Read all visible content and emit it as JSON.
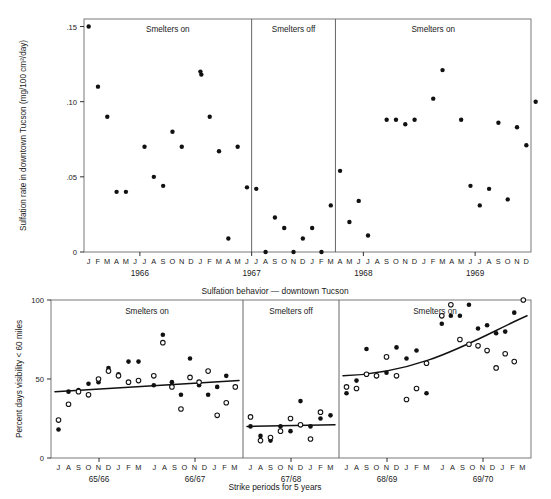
{
  "figure": {
    "caption_top": "Sulfation behavior — downtown Tucson",
    "caption_bottom": "Strike periods for 5 years"
  },
  "chart_data": [
    {
      "type": "scatter",
      "id": "sulfation-rate",
      "title": "Sulfation behavior — downtown Tucson",
      "xlabel": "",
      "ylabel": "Sulfation rate in downtown Tucson (mg/100 cm²/day)",
      "ylim": [
        0,
        0.155
      ],
      "yticks": [
        0,
        0.05,
        0.1,
        0.15
      ],
      "ytick_labels": [
        "0",
        ".05",
        ".10",
        ".15"
      ],
      "grid": false,
      "legend": "none",
      "x_months": [
        "J",
        "F",
        "M",
        "A",
        "M",
        "J",
        "J",
        "A",
        "S",
        "O",
        "N",
        "D"
      ],
      "year_labels": [
        "1966",
        "1967",
        "1968",
        "1969"
      ],
      "panels": [
        {
          "label": "Smelters on",
          "start_index": 0,
          "end_index": 18
        },
        {
          "label": "Smelters off",
          "start_index": 18,
          "end_index": 27
        },
        {
          "label": "Smelters on",
          "start_index": 27,
          "end_index": 48
        }
      ],
      "points": [
        {
          "t": 0,
          "month": "J 1966",
          "y": 0.15
        },
        {
          "t": 1,
          "month": "F 1966",
          "y": 0.11
        },
        {
          "t": 2,
          "month": "M 1966",
          "y": 0.09
        },
        {
          "t": 3,
          "month": "A 1966",
          "y": 0.04
        },
        {
          "t": 4,
          "month": "M 1966",
          "y": 0.04
        },
        {
          "t": 6,
          "month": "J 1966",
          "y": 0.07
        },
        {
          "t": 7,
          "month": "A 1966",
          "y": 0.05
        },
        {
          "t": 8,
          "month": "S 1966",
          "y": 0.044
        },
        {
          "t": 9,
          "month": "O 1966",
          "y": 0.08
        },
        {
          "t": 10,
          "month": "N 1966",
          "y": 0.07
        },
        {
          "t": 12,
          "month": "J 1967",
          "y": 0.12
        },
        {
          "t": 12.1,
          "month": "J 1967",
          "y": 0.118
        },
        {
          "t": 13,
          "month": "F 1967",
          "y": 0.09
        },
        {
          "t": 14,
          "month": "M 1967",
          "y": 0.067
        },
        {
          "t": 15,
          "month": "A 1967",
          "y": 0.009
        },
        {
          "t": 16,
          "month": "M 1967",
          "y": 0.07
        },
        {
          "t": 17,
          "month": "J 1967",
          "y": 0.043
        },
        {
          "t": 18,
          "month": "J 1967",
          "y": 0.042
        },
        {
          "t": 19,
          "month": "A 1967",
          "y": 0.0
        },
        {
          "t": 20,
          "month": "S 1967",
          "y": 0.023
        },
        {
          "t": 21,
          "month": "O 1967",
          "y": 0.016
        },
        {
          "t": 22,
          "month": "N 1967",
          "y": 0.0
        },
        {
          "t": 23,
          "month": "D 1967",
          "y": 0.009
        },
        {
          "t": 24,
          "month": "J 1968",
          "y": 0.016
        },
        {
          "t": 25,
          "month": "F 1968",
          "y": 0.0
        },
        {
          "t": 26,
          "month": "M 1968",
          "y": 0.031
        },
        {
          "t": 27,
          "month": "A 1968",
          "y": 0.054
        },
        {
          "t": 28,
          "month": "M 1968",
          "y": 0.02
        },
        {
          "t": 29,
          "month": "J 1968",
          "y": 0.034
        },
        {
          "t": 30,
          "month": "J 1968",
          "y": 0.011
        },
        {
          "t": 32,
          "month": "S 1968",
          "y": 0.088
        },
        {
          "t": 33,
          "month": "O 1968",
          "y": 0.088
        },
        {
          "t": 34,
          "month": "N 1968",
          "y": 0.085
        },
        {
          "t": 35,
          "month": "D 1968",
          "y": 0.088
        },
        {
          "t": 37,
          "month": "F 1969",
          "y": 0.102
        },
        {
          "t": 38,
          "month": "M 1969",
          "y": 0.121
        },
        {
          "t": 40,
          "month": "M 1969",
          "y": 0.088
        },
        {
          "t": 41,
          "month": "J 1969",
          "y": 0.044
        },
        {
          "t": 42,
          "month": "J 1969",
          "y": 0.031
        },
        {
          "t": 43,
          "month": "A 1969",
          "y": 0.042
        },
        {
          "t": 44,
          "month": "S 1969",
          "y": 0.086
        },
        {
          "t": 45,
          "month": "O 1969",
          "y": 0.035
        },
        {
          "t": 46,
          "month": "N 1969",
          "y": 0.083
        },
        {
          "t": 47,
          "month": "D 1969",
          "y": 0.071
        },
        {
          "t": 48,
          "month": "D 1969",
          "y": 0.1
        }
      ]
    },
    {
      "type": "scatter",
      "id": "visibility-percent",
      "title": "",
      "xlabel": "Strike periods for 5 years",
      "ylabel": "Percent days visibility < 60 miles",
      "ylim": [
        0,
        100
      ],
      "yticks": [
        0,
        50,
        100
      ],
      "ytick_labels": [
        "0",
        "50",
        "100"
      ],
      "grid": false,
      "legend": "none",
      "x_months": [
        "J",
        "A",
        "S",
        "O",
        "N",
        "D",
        "J",
        "F",
        "M"
      ],
      "period_labels": [
        "65/66",
        "66/67",
        "67/68",
        "68/69",
        "69/70"
      ],
      "panels": [
        {
          "label": "Smelters on",
          "periods": [
            "65/66",
            "66/67"
          ]
        },
        {
          "label": "Smelters off",
          "periods": [
            "67/68"
          ]
        },
        {
          "label": "Smelters on",
          "periods": [
            "68/69",
            "69/70"
          ]
        }
      ],
      "series": [
        {
          "name": "filled",
          "marker": "filled-circle",
          "values": [
            {
              "p": 0,
              "i": 0,
              "y": 18
            },
            {
              "p": 0,
              "i": 1,
              "y": 42
            },
            {
              "p": 0,
              "i": 2,
              "y": 43
            },
            {
              "p": 0,
              "i": 3,
              "y": 47
            },
            {
              "p": 0,
              "i": 4,
              "y": 48
            },
            {
              "p": 0,
              "i": 5,
              "y": 57
            },
            {
              "p": 0,
              "i": 6,
              "y": 53
            },
            {
              "p": 0,
              "i": 7,
              "y": 61
            },
            {
              "p": 0,
              "i": 8,
              "y": 61
            },
            {
              "p": 1,
              "i": 0,
              "y": 46
            },
            {
              "p": 1,
              "i": 1,
              "y": 78
            },
            {
              "p": 1,
              "i": 2,
              "y": 48
            },
            {
              "p": 1,
              "i": 3,
              "y": 40
            },
            {
              "p": 1,
              "i": 4,
              "y": 63
            },
            {
              "p": 1,
              "i": 5,
              "y": 46
            },
            {
              "p": 1,
              "i": 6,
              "y": 40
            },
            {
              "p": 1,
              "i": 7,
              "y": 45
            },
            {
              "p": 1,
              "i": 8,
              "y": 52
            },
            {
              "p": 2,
              "i": 0,
              "y": 20
            },
            {
              "p": 2,
              "i": 1,
              "y": 14
            },
            {
              "p": 2,
              "i": 2,
              "y": 11
            },
            {
              "p": 2,
              "i": 3,
              "y": 20
            },
            {
              "p": 2,
              "i": 4,
              "y": 17
            },
            {
              "p": 2,
              "i": 5,
              "y": 36
            },
            {
              "p": 2,
              "i": 6,
              "y": 20
            },
            {
              "p": 2,
              "i": 7,
              "y": 25
            },
            {
              "p": 2,
              "i": 8,
              "y": 27
            },
            {
              "p": 3,
              "i": 0,
              "y": 41
            },
            {
              "p": 3,
              "i": 1,
              "y": 49
            },
            {
              "p": 3,
              "i": 2,
              "y": 69
            },
            {
              "p": 3,
              "i": 3,
              "y": 52
            },
            {
              "p": 3,
              "i": 4,
              "y": 54
            },
            {
              "p": 3,
              "i": 5,
              "y": 70
            },
            {
              "p": 3,
              "i": 6,
              "y": 63
            },
            {
              "p": 3,
              "i": 7,
              "y": 68
            },
            {
              "p": 3,
              "i": 8,
              "y": 41
            },
            {
              "p": 4,
              "i": 0,
              "y": 85
            },
            {
              "p": 4,
              "i": 1,
              "y": 90
            },
            {
              "p": 4,
              "i": 2,
              "y": 90
            },
            {
              "p": 4,
              "i": 3,
              "y": 97
            },
            {
              "p": 4,
              "i": 4,
              "y": 82
            },
            {
              "p": 4,
              "i": 5,
              "y": 84
            },
            {
              "p": 4,
              "i": 6,
              "y": 79
            },
            {
              "p": 4,
              "i": 7,
              "y": 80
            },
            {
              "p": 4,
              "i": 8,
              "y": 92
            },
            {
              "p": 4,
              "i": 9,
              "y": 100
            }
          ]
        },
        {
          "name": "open",
          "marker": "open-circle",
          "values": [
            {
              "p": 0,
              "i": 0,
              "y": 24
            },
            {
              "p": 0,
              "i": 1,
              "y": 34
            },
            {
              "p": 0,
              "i": 2,
              "y": 42
            },
            {
              "p": 0,
              "i": 3,
              "y": 40
            },
            {
              "p": 0,
              "i": 4,
              "y": 50
            },
            {
              "p": 0,
              "i": 5,
              "y": 55
            },
            {
              "p": 0,
              "i": 6,
              "y": 52
            },
            {
              "p": 0,
              "i": 7,
              "y": 48
            },
            {
              "p": 0,
              "i": 8,
              "y": 49
            },
            {
              "p": 1,
              "i": 0,
              "y": 52
            },
            {
              "p": 1,
              "i": 1,
              "y": 73
            },
            {
              "p": 1,
              "i": 2,
              "y": 45
            },
            {
              "p": 1,
              "i": 3,
              "y": 31
            },
            {
              "p": 1,
              "i": 4,
              "y": 51
            },
            {
              "p": 1,
              "i": 5,
              "y": 48
            },
            {
              "p": 1,
              "i": 6,
              "y": 55
            },
            {
              "p": 1,
              "i": 7,
              "y": 27
            },
            {
              "p": 1,
              "i": 8,
              "y": 35
            },
            {
              "p": 1,
              "i": 9,
              "y": 45
            },
            {
              "p": 2,
              "i": 0,
              "y": 26
            },
            {
              "p": 2,
              "i": 1,
              "y": 11
            },
            {
              "p": 2,
              "i": 2,
              "y": 13
            },
            {
              "p": 2,
              "i": 3,
              "y": 17
            },
            {
              "p": 2,
              "i": 4,
              "y": 25
            },
            {
              "p": 2,
              "i": 5,
              "y": 21
            },
            {
              "p": 2,
              "i": 6,
              "y": 12
            },
            {
              "p": 2,
              "i": 7,
              "y": 29
            },
            {
              "p": 3,
              "i": 0,
              "y": 45
            },
            {
              "p": 3,
              "i": 1,
              "y": 44
            },
            {
              "p": 3,
              "i": 2,
              "y": 53
            },
            {
              "p": 3,
              "i": 3,
              "y": 52
            },
            {
              "p": 3,
              "i": 4,
              "y": 64
            },
            {
              "p": 3,
              "i": 5,
              "y": 52
            },
            {
              "p": 3,
              "i": 6,
              "y": 37
            },
            {
              "p": 3,
              "i": 7,
              "y": 44
            },
            {
              "p": 3,
              "i": 8,
              "y": 60
            },
            {
              "p": 4,
              "i": 0,
              "y": 90
            },
            {
              "p": 4,
              "i": 1,
              "y": 97
            },
            {
              "p": 4,
              "i": 2,
              "y": 75
            },
            {
              "p": 4,
              "i": 3,
              "y": 72
            },
            {
              "p": 4,
              "i": 4,
              "y": 71
            },
            {
              "p": 4,
              "i": 5,
              "y": 68
            },
            {
              "p": 4,
              "i": 6,
              "y": 57
            },
            {
              "p": 4,
              "i": 7,
              "y": 66
            },
            {
              "p": 4,
              "i": 8,
              "y": 61
            },
            {
              "p": 4,
              "i": 9,
              "y": 100
            }
          ]
        }
      ],
      "trend_lines": [
        {
          "panel": 0,
          "y_start": 42,
          "y_end": 49,
          "curved": false
        },
        {
          "panel": 1,
          "y_start": 20,
          "y_end": 21,
          "curved": false
        },
        {
          "panel": 2,
          "y_start": 52,
          "y_end": 90,
          "curved": true
        }
      ]
    }
  ]
}
